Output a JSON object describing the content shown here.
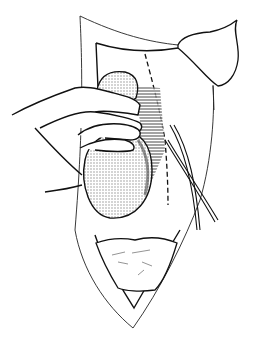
{
  "figure": {
    "type": "surgical-line-illustration",
    "colors": {
      "background": "#ffffff",
      "ink": "#111111",
      "stipple": "#8a8a8a",
      "hatch": "#333333"
    },
    "elements": [
      {
        "name": "outer-incision-edge"
      },
      {
        "name": "inner-wound-edge"
      },
      {
        "name": "retracted-skin-flap"
      },
      {
        "name": "dashed-incision-line"
      },
      {
        "name": "hand"
      },
      {
        "name": "upper-organ-lobe"
      },
      {
        "name": "lower-organ"
      },
      {
        "name": "hatched-tissue"
      },
      {
        "name": "vessel-bundle"
      },
      {
        "name": "bowel-loops"
      }
    ]
  }
}
